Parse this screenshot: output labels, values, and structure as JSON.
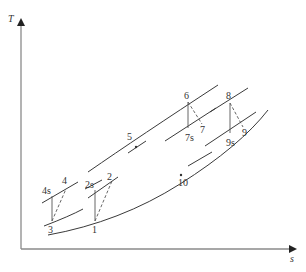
{
  "diagram": {
    "type": "T-s diagram",
    "axes": {
      "y_label": "T",
      "x_label": "s"
    },
    "points": {
      "p1": "1",
      "p2": "2",
      "p2s": "2s",
      "p3": "3",
      "p4": "4",
      "p4s": "4s",
      "p5": "5",
      "p6": "6",
      "p7": "7",
      "p7s": "7s",
      "p8": "8",
      "p9": "9",
      "p9s": "9s",
      "p10": "10"
    },
    "colors": {
      "axis": "#8a8a8a",
      "line": "#3a3a3a",
      "background": "#ffffff"
    }
  }
}
